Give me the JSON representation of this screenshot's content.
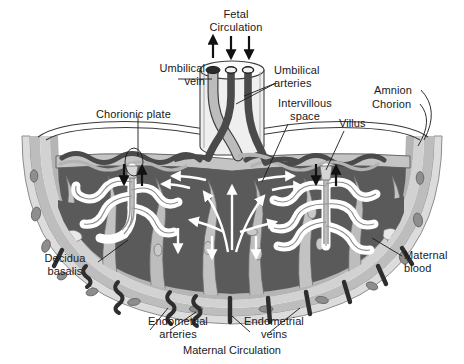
{
  "figure": {
    "title_caption_top": "Fetal\nCirculation",
    "caption_bottom": "Maternal Circulation"
  },
  "labels": [
    {
      "id": "fetal-circulation",
      "text": "Fetal\nCirculation",
      "x": 196,
      "y": 8,
      "w": 80,
      "align": "center"
    },
    {
      "id": "umbilical-vein",
      "text": "Umbilical\nvein",
      "x": 133,
      "y": 62,
      "w": 72,
      "align": "right"
    },
    {
      "id": "umbilical-arteries",
      "text": "Umbilical\narteries",
      "x": 274,
      "y": 64,
      "w": 70,
      "align": "left"
    },
    {
      "id": "chorionic-plate",
      "text": "Chorionic plate",
      "x": 96,
      "y": 108,
      "w": 84,
      "align": "left"
    },
    {
      "id": "intervillous-space",
      "text": "Intervillous\nspace",
      "x": 272,
      "y": 97,
      "w": 66,
      "align": "center"
    },
    {
      "id": "villus",
      "text": "Villus",
      "x": 339,
      "y": 117,
      "w": 36,
      "align": "left"
    },
    {
      "id": "amnion",
      "text": "Amnion",
      "x": 374,
      "y": 84,
      "w": 46,
      "align": "left"
    },
    {
      "id": "chorion",
      "text": "Chorion",
      "x": 372,
      "y": 98,
      "w": 46,
      "align": "left"
    },
    {
      "id": "decidua-basalis",
      "text": "Decidua\nbasalis",
      "x": 34,
      "y": 252,
      "w": 62,
      "align": "center"
    },
    {
      "id": "maternal-blood",
      "text": "Maternal\nblood",
      "x": 404,
      "y": 249,
      "w": 58,
      "align": "left"
    },
    {
      "id": "endometrial-arteries",
      "text": "Endometrial\narteries",
      "x": 140,
      "y": 315,
      "w": 76,
      "align": "center"
    },
    {
      "id": "endometrial-veins",
      "text": "Endometrial\nveins",
      "x": 236,
      "y": 315,
      "w": 76,
      "align": "center"
    },
    {
      "id": "maternal-circulation",
      "text": "Maternal Circulation",
      "x": 0,
      "y": 344,
      "w": 464,
      "align": "center"
    }
  ],
  "colors": {
    "ink": "#1a1a1a",
    "intervillous_space": "#555555",
    "decidua_outer": "#d8d8d8",
    "decidua_mid": "#b9b9b9",
    "decidua_inner": "#c9c9c9",
    "septum": "#a8a8a8",
    "villus_white": "#ffffff",
    "vessel_dark": "#4a4a4a",
    "vessel_light": "#b0b0b0",
    "chorionic_plate": "#bfbfbf",
    "arrow_white": "#ffffff",
    "arrow_black": "#111111",
    "background": "#ffffff"
  },
  "anatomy": {
    "cord_vessels": [
      {
        "name": "umbilical-vein",
        "tone": "light",
        "flow": "up"
      },
      {
        "name": "umbilical-artery-1",
        "tone": "dark",
        "flow": "down"
      },
      {
        "name": "umbilical-artery-2",
        "tone": "dark",
        "flow": "down"
      }
    ],
    "flow_arrows": {
      "fetal_up_count": 1,
      "fetal_down_count": 2,
      "maternal_white_arrow_count": 10,
      "black_arrow_count": 4
    },
    "villus_tree_count": 2,
    "structures": [
      "amnion",
      "chorion",
      "chorionic plate",
      "intervillous space",
      "villus",
      "decidua basalis",
      "maternal blood",
      "endometrial arteries",
      "endometrial veins"
    ]
  }
}
